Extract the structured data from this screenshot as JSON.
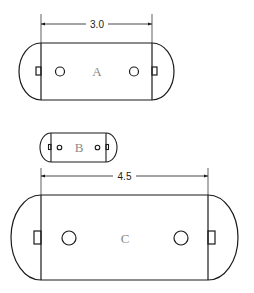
{
  "diagram": {
    "type": "technical-drawing",
    "colors": {
      "line": "#1a1a1a",
      "label": "#8a8a8a",
      "background": "#ffffff"
    },
    "parts": [
      {
        "id": "A",
        "label": "A",
        "dimension": "3.0"
      },
      {
        "id": "B",
        "label": "B",
        "dimension": ""
      },
      {
        "id": "C",
        "label": "C",
        "dimension": "4.5"
      }
    ]
  }
}
